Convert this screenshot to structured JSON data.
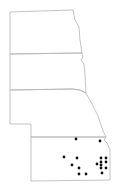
{
  "map": {
    "type": "distribution-map",
    "states": [
      {
        "name": "North Dakota",
        "path": "M10,12 L73,10 L75,20 L79,27 L80,40 L82,53 L10,54 Z"
      },
      {
        "name": "South Dakota",
        "path": "M10,54 L82,53 L83,57 L81,60 L84,64 L85,75 L86,93 L80,90 L72,89 L10,90 Z"
      },
      {
        "name": "Nebraska",
        "path": "M10,90 L72,89 L80,90 L86,93 L92,104 L98,116 L102,128 L104,133 L106,137 L31,137 L31,124 L10,124 Z"
      },
      {
        "name": "Kansas",
        "path": "M31,137 L106,137 L104,140 L107,143 L110,150 L110,180 L31,181 Z"
      }
    ],
    "points": [
      {
        "x": 76,
        "y": 139
      },
      {
        "x": 100,
        "y": 141
      },
      {
        "x": 64,
        "y": 157
      },
      {
        "x": 77,
        "y": 158
      },
      {
        "x": 72,
        "y": 165
      },
      {
        "x": 79,
        "y": 168
      },
      {
        "x": 79,
        "y": 174
      },
      {
        "x": 86,
        "y": 174
      },
      {
        "x": 101,
        "y": 158
      },
      {
        "x": 106,
        "y": 158
      },
      {
        "x": 101,
        "y": 162
      },
      {
        "x": 106,
        "y": 162
      },
      {
        "x": 97,
        "y": 164
      },
      {
        "x": 101,
        "y": 165
      },
      {
        "x": 106,
        "y": 168
      },
      {
        "x": 101,
        "y": 168
      },
      {
        "x": 102,
        "y": 173
      }
    ],
    "colors": {
      "border": "#b4b4b4",
      "point": "#111111",
      "background": "#ffffff"
    }
  }
}
